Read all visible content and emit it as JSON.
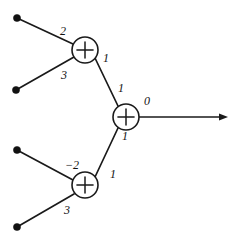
{
  "diagram": {
    "type": "node-link-diagram",
    "colors": {
      "stroke": "#1a1a1a",
      "background": "#ffffff",
      "label": "#121212"
    },
    "nodes": [
      {
        "id": "adder-top",
        "symbol": "+",
        "cx": 85,
        "cy": 50,
        "r": 13
      },
      {
        "id": "adder-center",
        "symbol": "+",
        "cx": 126,
        "cy": 117,
        "r": 13
      },
      {
        "id": "adder-bottom",
        "symbol": "+",
        "cx": 85,
        "cy": 185,
        "r": 13
      }
    ],
    "terminals": [
      {
        "id": "input-1",
        "cx": 17,
        "cy": 18,
        "r": 3.6
      },
      {
        "id": "input-2",
        "cx": 16,
        "cy": 90,
        "r": 3.6
      },
      {
        "id": "input-3",
        "cx": 17,
        "cy": 150,
        "r": 3.6
      },
      {
        "id": "input-4",
        "cx": 17,
        "cy": 227,
        "r": 3.6
      }
    ],
    "edges": [
      {
        "id": "edge-in1-addertop",
        "x1": 17,
        "y1": 18,
        "x2": 73,
        "y2": 44
      },
      {
        "id": "edge-in2-addertop",
        "x1": 16,
        "y1": 90,
        "x2": 74,
        "y2": 57
      },
      {
        "id": "edge-addertop-addercenter",
        "x1": 95,
        "y1": 58,
        "x2": 118,
        "y2": 106
      },
      {
        "id": "edge-in3-adderbottom",
        "x1": 17,
        "y1": 150,
        "x2": 73,
        "y2": 180
      },
      {
        "id": "edge-in4-adderbottom",
        "x1": 17,
        "y1": 227,
        "x2": 74,
        "y2": 194
      },
      {
        "id": "edge-adderbottom-addercenter",
        "x1": 95,
        "y1": 177,
        "x2": 118,
        "y2": 128
      }
    ],
    "output": {
      "id": "edge-addercenter-output",
      "x1": 139,
      "y1": 117,
      "x2": 228,
      "y2": 117,
      "arrow": true
    },
    "labels": [
      {
        "id": "label-weight-2",
        "text": "2",
        "x": 63,
        "y": 31
      },
      {
        "id": "label-weight-3-top",
        "text": "3",
        "x": 64,
        "y": 75
      },
      {
        "id": "label-weight-1-top",
        "text": "1",
        "x": 106,
        "y": 58
      },
      {
        "id": "label-weight-1-upper",
        "text": "1",
        "x": 121,
        "y": 88
      },
      {
        "id": "label-weight-0",
        "text": "0",
        "x": 147,
        "y": 101
      },
      {
        "id": "label-weight-1-lower",
        "text": "1",
        "x": 125,
        "y": 136
      },
      {
        "id": "label-weight-1-bot",
        "text": "1",
        "x": 113,
        "y": 174
      },
      {
        "id": "label-weight-neg2",
        "text": "−2",
        "x": 72,
        "y": 165
      },
      {
        "id": "label-weight-3-bot",
        "text": "3",
        "x": 67,
        "y": 210
      }
    ]
  }
}
